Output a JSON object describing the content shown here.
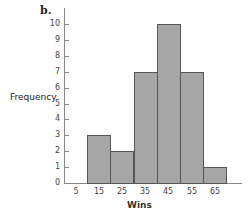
{
  "panel_label": "b.",
  "chart_data": {
    "type": "bar",
    "title": "",
    "panel": "b.",
    "xlabel": "Wins",
    "ylabel": "Frequency",
    "categories": [
      "5",
      "15",
      "25",
      "35",
      "45",
      "55",
      "65"
    ],
    "values": [
      0,
      3,
      2,
      7,
      10,
      7,
      1
    ],
    "ylim": [
      0,
      10
    ],
    "yticks": [
      "0",
      "1",
      "2",
      "3",
      "4",
      "5",
      "6",
      "7",
      "8",
      "9",
      "10"
    ],
    "grid": false,
    "legend": null,
    "bar_color": "#a6a6a6",
    "edge_color": "#555555"
  }
}
